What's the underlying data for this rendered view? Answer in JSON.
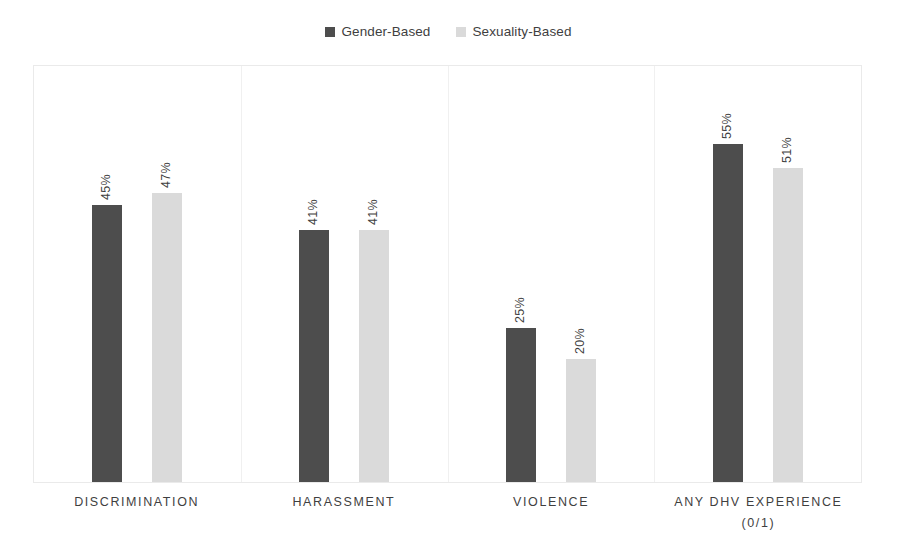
{
  "chart_data": {
    "type": "bar",
    "title": "",
    "subtitle": "",
    "xlabel": "",
    "ylabel": "",
    "ylim": [
      0,
      68
    ],
    "grid": false,
    "legend_position": "top-center",
    "orientation": "vertical",
    "grouping": "grouped",
    "value_format": "percent",
    "categories": [
      "DISCRIMINATION",
      "HARASSMENT",
      "VIOLENCE",
      "ANY DHV EXPERIENCE\n(0/1)"
    ],
    "series": [
      {
        "name": "Gender-Based",
        "color": "#4d4d4d",
        "values": [
          45,
          41,
          25,
          55
        ],
        "labels": [
          "45%",
          "41%",
          "25%",
          "55%"
        ]
      },
      {
        "name": "Sexuality-Based",
        "color": "#dadada",
        "values": [
          47,
          41,
          20,
          51
        ],
        "labels": [
          "47%",
          "41%",
          "20%",
          "51%"
        ]
      }
    ]
  },
  "legend": {
    "entries": [
      {
        "label": "Gender-Based",
        "swatch": "#4d4d4d"
      },
      {
        "label": "Sexuality-Based",
        "swatch": "#dadada"
      }
    ]
  },
  "axis": {
    "category_labels": [
      "DISCRIMINATION",
      "HARASSMENT",
      "VIOLENCE",
      "ANY DHV EXPERIENCE\n(0/1)"
    ]
  },
  "colors": {
    "series_gender": "#4d4d4d",
    "series_sexuality": "#dadada",
    "plot_border": "#eaeaea",
    "separator": "#f0f0f0",
    "text": "#3f3f3f",
    "background": "#ffffff"
  }
}
